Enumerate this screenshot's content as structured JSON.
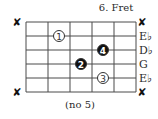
{
  "diagram": {
    "fret_label": "6. Fret",
    "footer": "(no 5)",
    "frets_shown": 5,
    "strings": [
      {
        "label": "",
        "muted": true
      },
      {
        "label": "E♭",
        "muted": false
      },
      {
        "label": "D♭",
        "muted": false
      },
      {
        "label": "G",
        "muted": false
      },
      {
        "label": "E♭",
        "muted": false
      },
      {
        "label": "",
        "muted": true
      }
    ],
    "mute_symbol": "✘",
    "fingers": [
      {
        "finger": "1",
        "string": 2,
        "fret": 2,
        "style": "open"
      },
      {
        "finger": "4",
        "string": 3,
        "fret": 4,
        "style": "filled"
      },
      {
        "finger": "2",
        "string": 4,
        "fret": 3,
        "style": "filled"
      },
      {
        "finger": "3",
        "string": 5,
        "fret": 4,
        "style": "open"
      }
    ]
  }
}
